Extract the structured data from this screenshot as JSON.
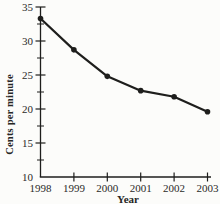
{
  "figure": {
    "kind": "scanned textbook line graph",
    "background_color": "#fcfcfa",
    "ink_color": "#1e1e1c",
    "text_color": "#2a2a28"
  },
  "chart_data": {
    "type": "line",
    "title": "",
    "xlabel": "Year",
    "ylabel": "Cents per minute",
    "categories": [
      "1998",
      "1999",
      "2000",
      "2001",
      "2002",
      "2003"
    ],
    "values": [
      33.3,
      28.7,
      24.8,
      22.7,
      21.8,
      19.6
    ],
    "ylim": [
      10,
      35
    ],
    "y_major_ticks": [
      10,
      15,
      20,
      25,
      30,
      35
    ],
    "y_minor_ticks": [
      12.5,
      17.5,
      22.5,
      27.5,
      32.5
    ],
    "grid": false,
    "legend": false,
    "marker": "filled-circle",
    "line_color": "#1e1e1c"
  }
}
